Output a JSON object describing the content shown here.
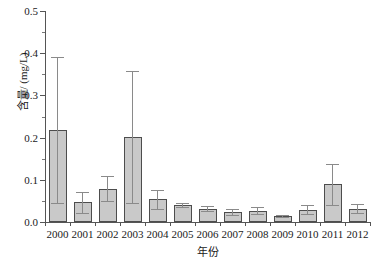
{
  "chart_data": {
    "type": "bar",
    "title": "",
    "xlabel": "年份",
    "ylabel": "含量/ (mg/L)",
    "categories": [
      "2000",
      "2001",
      "2002",
      "2003",
      "2004",
      "2005",
      "2006",
      "2007",
      "2008",
      "2009",
      "2010",
      "2011",
      "2012"
    ],
    "values": [
      0.218,
      0.047,
      0.079,
      0.201,
      0.055,
      0.04,
      0.032,
      0.023,
      0.027,
      0.014,
      0.028,
      0.09,
      0.03
    ],
    "error_low": [
      0.045,
      0.022,
      0.049,
      0.045,
      0.031,
      0.035,
      0.027,
      0.017,
      0.019,
      0.011,
      0.019,
      0.04,
      0.021
    ],
    "error_high": [
      0.391,
      0.071,
      0.108,
      0.358,
      0.077,
      0.044,
      0.037,
      0.03,
      0.036,
      0.016,
      0.04,
      0.137,
      0.042
    ],
    "ylim": [
      0.0,
      0.5
    ],
    "ytick_labels": [
      "0.0",
      "0.1",
      "0.2",
      "0.3",
      "0.4",
      "0.5"
    ],
    "ytick_values": [
      0.0,
      0.1,
      0.2,
      0.3,
      0.4,
      0.5
    ],
    "yminor_values": [
      0.05,
      0.15,
      0.25,
      0.35,
      0.45
    ],
    "grid": false,
    "legend": null,
    "bar_fill_color": "#c9c9c9",
    "bar_edge_color": "#4d4d4d",
    "error_bar_color": "#8a8a8a",
    "axis_color": "#555555"
  }
}
